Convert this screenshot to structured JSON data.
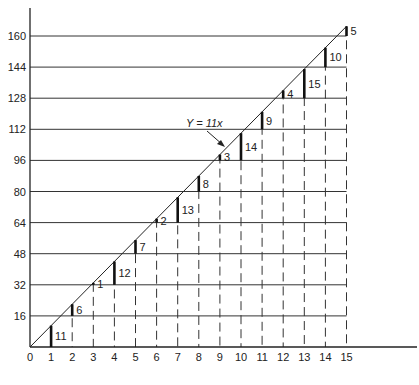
{
  "chart_data": {
    "type": "line",
    "title": "",
    "xlabel": "",
    "ylabel": "",
    "xlim": [
      0,
      15
    ],
    "ylim": [
      0,
      160
    ],
    "grid": "horizontal lines every 16; dashed verticals at each integer x",
    "x_ticks": [
      "0",
      "1",
      "2",
      "3",
      "4",
      "5",
      "6",
      "7",
      "8",
      "9",
      "10",
      "11",
      "12",
      "13",
      "14",
      "15"
    ],
    "y_ticks": [
      "16",
      "32",
      "48",
      "64",
      "80",
      "96",
      "112",
      "128",
      "144",
      "160"
    ],
    "line": {
      "label": "Y = 11x",
      "slope": 11,
      "x": [
        0,
        15
      ],
      "y": [
        0,
        165
      ]
    },
    "remainder_bars": {
      "description": "Vertical bar at each integer x from the highest multiple of 16 below 11x up to the line, labeled with 11x mod 16",
      "x": [
        1,
        2,
        3,
        4,
        5,
        6,
        7,
        8,
        9,
        10,
        11,
        12,
        13,
        14,
        15
      ],
      "y": [
        11,
        22,
        33,
        44,
        55,
        66,
        77,
        88,
        99,
        110,
        121,
        132,
        143,
        154,
        165
      ],
      "labels": [
        "11",
        "6",
        "1",
        "12",
        "7",
        "2",
        "13",
        "8",
        "3",
        "14",
        "9",
        "4",
        "15",
        "10",
        "5"
      ]
    }
  },
  "annotation": {
    "text": "Y = 11x"
  }
}
